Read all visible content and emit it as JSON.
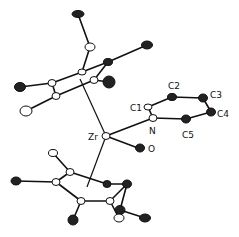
{
  "figure": {
    "type": "ORTEP molecular structure",
    "labels": {
      "zr": "Zr",
      "n": "N",
      "o": "O",
      "c1": "C1",
      "c2": "C2",
      "c3": "C3",
      "c4": "C4",
      "c5": "C5"
    },
    "colors": {
      "ink": "#111111",
      "background": "#ffffff"
    }
  }
}
